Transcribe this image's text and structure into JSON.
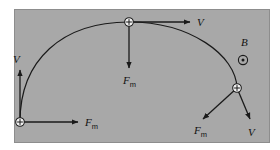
{
  "figure": {
    "type": "physics-diagram",
    "panel": {
      "background_color": "#a8a8a8",
      "border_color": "#8d8d8d",
      "x": 14,
      "y": 9,
      "width": 256,
      "height": 134
    },
    "page_background_color": "#ffffff",
    "stroke_color": "#1a1a1a"
  },
  "field": {
    "label": "B",
    "symbol_name": "field-out-of-page-dot",
    "direction": "out of page",
    "label_x": 241,
    "label_y": 46,
    "symbol_x": 243,
    "symbol_y": 60
  },
  "trajectory": {
    "shape": "circular arc",
    "description": "counterclockwise-looking arc from lower-left, over the top, down to the right",
    "path": "M 20,122 C 20,60 62,22 129,22 C 190,22 236,55 237,88"
  },
  "charges": [
    {
      "id": "charge-bottom-left",
      "sign": "+",
      "x": 20,
      "y": 122,
      "vectors": [
        {
          "name": "velocity",
          "label": "V",
          "subscript": "",
          "direction": "up",
          "x1": 20,
          "y1": 122,
          "x2": 20,
          "y2": 70,
          "label_x": 13,
          "label_y": 63
        },
        {
          "name": "magnetic-force",
          "label": "F",
          "subscript": "m",
          "direction": "right",
          "x1": 20,
          "y1": 122,
          "x2": 78,
          "y2": 122,
          "label_x": 85,
          "label_y": 126
        }
      ]
    },
    {
      "id": "charge-top",
      "sign": "+",
      "x": 129,
      "y": 22,
      "vectors": [
        {
          "name": "velocity",
          "label": "V",
          "subscript": "",
          "direction": "right",
          "x1": 129,
          "y1": 22,
          "x2": 190,
          "y2": 22,
          "label_x": 197,
          "label_y": 26
        },
        {
          "name": "magnetic-force",
          "label": "F",
          "subscript": "m",
          "direction": "down",
          "x1": 129,
          "y1": 22,
          "x2": 129,
          "y2": 68,
          "label_x": 123,
          "label_y": 84
        }
      ]
    },
    {
      "id": "charge-right",
      "sign": "+",
      "x": 237,
      "y": 88,
      "vectors": [
        {
          "name": "magnetic-force",
          "label": "F",
          "subscript": "m",
          "direction": "down-left",
          "x1": 237,
          "y1": 88,
          "x2": 203,
          "y2": 119,
          "label_x": 194,
          "label_y": 134
        },
        {
          "name": "velocity",
          "label": "V",
          "subscript": "",
          "direction": "down-right",
          "x1": 237,
          "y1": 88,
          "x2": 250,
          "y2": 119,
          "label_x": 248,
          "label_y": 136
        }
      ]
    }
  ]
}
